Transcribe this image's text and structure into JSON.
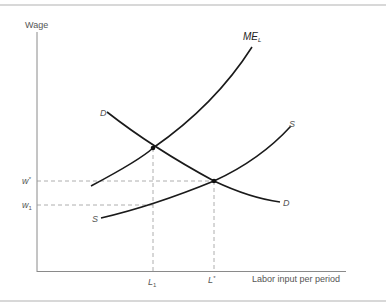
{
  "diagram": {
    "axes": {
      "y_label": "Wage",
      "x_label": "Labor input per period"
    },
    "curves": [
      {
        "name": "ME",
        "subscript": "L",
        "label": "ME_L",
        "description": "Marginal expenditure on labor"
      },
      {
        "name": "D",
        "label": "D",
        "description": "Demand for labor"
      },
      {
        "name": "S",
        "label": "S",
        "description": "Supply of labor"
      }
    ],
    "y_ticks": [
      {
        "label": "w",
        "sup": "*",
        "full": "w*"
      },
      {
        "label": "w",
        "sub": "1",
        "full": "w1"
      }
    ],
    "x_ticks": [
      {
        "label": "L",
        "sub": "1",
        "full": "L1"
      },
      {
        "label": "L",
        "sup": "*",
        "full": "L*"
      }
    ],
    "points": [
      {
        "name": "ME_L-D intersection",
        "x_tick": "L1"
      },
      {
        "name": "D-S intersection",
        "x_tick": "L*",
        "y_tick": "w*"
      }
    ],
    "colors": {
      "curve": "#1a1a1a",
      "axis": "#888888",
      "dashed": "#999999",
      "text": "#555555",
      "border": "#d8d8d8"
    }
  }
}
